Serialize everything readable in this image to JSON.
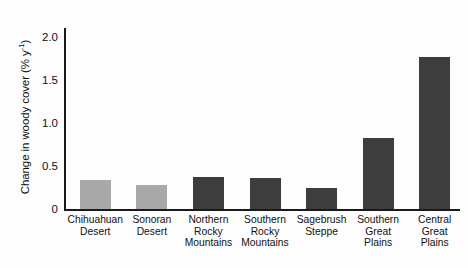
{
  "chart_data": {
    "type": "bar",
    "title": "",
    "xlabel": "",
    "ylabel": "Change in woody cover (% y",
    "ylabel_sup": "-1",
    "ylabel_suffix": ")",
    "ylim": [
      0,
      2.1
    ],
    "yticks": [
      0,
      0.5,
      1.0,
      1.5,
      2.0
    ],
    "ytick_labels": [
      "0",
      "0.5",
      "1.0",
      "1.5",
      "2.0"
    ],
    "grid": false,
    "legend": "none",
    "categories": [
      "Chihuahuan Desert",
      "Sonoran Desert",
      "Northern Rocky Mountains",
      "Southern Rocky Mountains",
      "Sagebrush Steppe",
      "Southern Great Plains",
      "Central Great Plains"
    ],
    "category_lines": [
      [
        "Chihuahuan",
        "Desert"
      ],
      [
        "Sonoran",
        "Desert"
      ],
      [
        "Northern",
        "Rocky",
        "Mountains"
      ],
      [
        "Southern",
        "Rocky",
        "Mountains"
      ],
      [
        "Sagebrush",
        "Steppe"
      ],
      [
        "Southern",
        "Great",
        "Plains"
      ],
      [
        "Central",
        "Great",
        "Plains"
      ]
    ],
    "values": [
      0.34,
      0.28,
      0.37,
      0.36,
      0.24,
      0.82,
      1.76
    ],
    "bar_colors": [
      "#a9a9a9",
      "#a9a9a9",
      "#3d3d3d",
      "#3d3d3d",
      "#3d3d3d",
      "#3d3d3d",
      "#3d3d3d"
    ],
    "colors": {
      "light_gray": "#a9a9a9",
      "dark_gray": "#3d3d3d",
      "axis": "#1a1a1a",
      "text": "#111111",
      "background": "#fdfdfd"
    }
  }
}
